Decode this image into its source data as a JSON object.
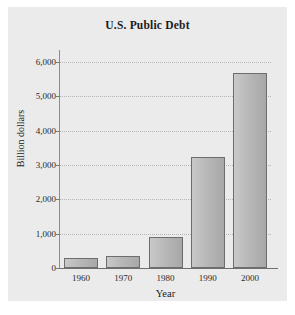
{
  "figure": {
    "background_color": "#ebebeb",
    "page_background_color": "#ffffff"
  },
  "chart_data": {
    "type": "bar",
    "title": "U.S. Public Debt",
    "xlabel": "Year",
    "ylabel": "Billion dollars",
    "categories": [
      "1960",
      "1970",
      "1980",
      "1990",
      "2000"
    ],
    "values": [
      290,
      350,
      900,
      3230,
      5670
    ],
    "ylim": [
      0,
      6000
    ],
    "ytick_labels": [
      "0",
      "1,000",
      "2,000",
      "3,000",
      "4,000",
      "5,000",
      "6,000"
    ],
    "ytick_values": [
      0,
      1000,
      2000,
      3000,
      4000,
      5000,
      6000
    ],
    "grid": true,
    "grid_axis": "y",
    "grid_style": "dotted",
    "legend": false,
    "bar_fill_color": "#b8b8b8",
    "bar_edge_color": "#6d6d6d",
    "axis_color": "#7a7a7a",
    "text_color": "#1b1b1b"
  }
}
